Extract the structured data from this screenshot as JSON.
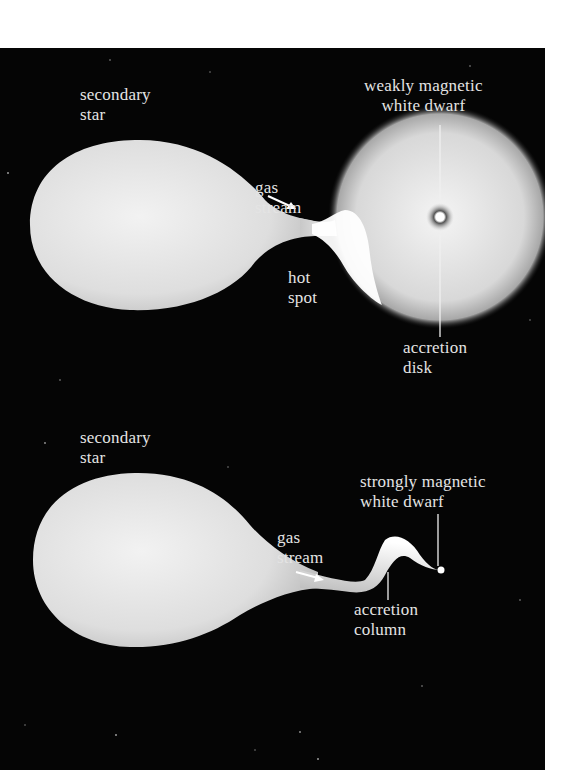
{
  "top_diagram": {
    "secondary_star_label": "secondary\nstar",
    "gas_stream_label": "gas\nstream",
    "hot_spot_label": "hot\nspot",
    "white_dwarf_label": "weakly magnetic\nwhite dwarf",
    "accretion_disk_label": "accretion\ndisk"
  },
  "bottom_diagram": {
    "secondary_star_label": "secondary\nstar",
    "gas_stream_label": "gas\nstream",
    "white_dwarf_label": "strongly magnetic\nwhite dwarf",
    "accretion_column_label": "accretion\ncolumn"
  },
  "colors": {
    "background": "#050505",
    "star_fill": "#dcdcdc",
    "label_text": "#e4e4e4"
  }
}
